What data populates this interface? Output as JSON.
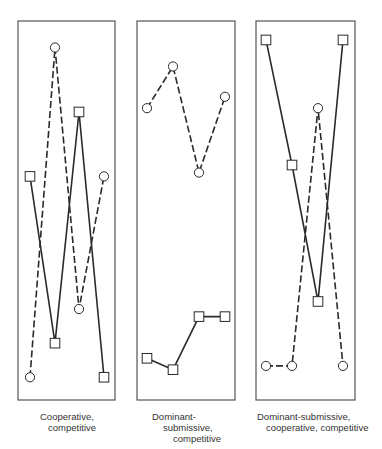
{
  "chart_data": [
    {
      "type": "line",
      "title": "Cooperative, competitive",
      "caption_lines": [
        "Cooperative,",
        "competitive"
      ],
      "x": [
        1,
        2,
        3,
        4
      ],
      "ylim": [
        0,
        100
      ],
      "grid": false,
      "axis_ticks": false,
      "series": [
        {
          "name": "circle-dashed",
          "marker": "circle",
          "line": "dashed",
          "values": [
            6,
            93,
            24,
            59
          ]
        },
        {
          "name": "square-solid",
          "marker": "square",
          "line": "solid",
          "values": [
            59,
            15,
            76,
            6
          ]
        }
      ]
    },
    {
      "type": "line",
      "title": "Dominant-submissive, competitive",
      "caption_lines": [
        "Dominant-",
        "submissive,",
        "competitive"
      ],
      "x": [
        1,
        2,
        3,
        4
      ],
      "ylim": [
        0,
        100
      ],
      "grid": false,
      "axis_ticks": false,
      "series": [
        {
          "name": "circle-dashed",
          "marker": "circle",
          "line": "dashed",
          "values": [
            77,
            88,
            60,
            80
          ]
        },
        {
          "name": "square-solid",
          "marker": "square",
          "line": "solid",
          "values": [
            11,
            8,
            22,
            22
          ]
        }
      ]
    },
    {
      "type": "line",
      "title": "Dominant-submissive, cooperative, competitive",
      "caption_lines": [
        "Dominant-submissive,",
        "cooperative, competitive"
      ],
      "x": [
        1,
        2,
        3,
        4
      ],
      "ylim": [
        0,
        100
      ],
      "grid": false,
      "axis_ticks": false,
      "series": [
        {
          "name": "square-solid",
          "marker": "square",
          "line": "solid",
          "values": [
            95,
            62,
            26,
            95
          ]
        },
        {
          "name": "circle-dashed",
          "marker": "circle",
          "line": "dashed",
          "values": [
            9,
            9,
            77,
            9
          ]
        }
      ]
    }
  ],
  "layout": {
    "panels": [
      {
        "left": 18,
        "right": 115,
        "top": 21,
        "bottom": 400,
        "xs": [
          30,
          55,
          79,
          104
        ],
        "caption_x": 40,
        "caption_indents": [
          0,
          8
        ]
      },
      {
        "left": 137,
        "right": 235,
        "top": 21,
        "bottom": 400,
        "xs": [
          147,
          173,
          199,
          225
        ],
        "caption_x": 152,
        "caption_indents": [
          0,
          11,
          21
        ]
      },
      {
        "left": 256,
        "right": 355,
        "top": 21,
        "bottom": 400,
        "xs": [
          266,
          292,
          318,
          343
        ],
        "caption_x": 257,
        "caption_indents": [
          0,
          9
        ]
      }
    ],
    "caption_top": 411,
    "plot_y_top": 41,
    "plot_y_bottom": 378,
    "stroke_color": "#2a2a2a",
    "frame_color": "#555555"
  }
}
